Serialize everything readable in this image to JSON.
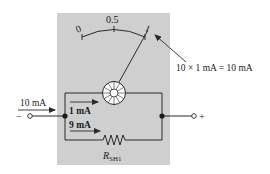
{
  "diagram": {
    "type": "ammeter-shunt-circuit",
    "colors": {
      "panel": "#cfcfcf",
      "wire": "#2a2a2a",
      "background": "#ffffff"
    },
    "meter_scale": {
      "labels": [
        "0",
        "0.5",
        "1"
      ]
    },
    "annotation": {
      "text": "10 × 1 mA = 10 mA"
    },
    "input_current": {
      "label": "10 mA"
    },
    "branches": [
      {
        "label": "1 mA",
        "element": "meter-movement"
      },
      {
        "label": "9 mA",
        "element": "shunt-resistor"
      }
    ],
    "resistor": {
      "label_main": "R",
      "label_sub": "SH1"
    },
    "terminals": {
      "negative": "−",
      "positive": "+"
    }
  }
}
